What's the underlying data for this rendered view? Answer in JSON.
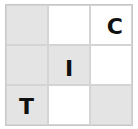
{
  "puzzle": {
    "rows": 3,
    "cols": 3,
    "colors": {
      "shaded": "#e4e4e4",
      "white": "#ffffff",
      "letter": "#111111"
    },
    "cells": [
      {
        "row": 0,
        "col": 0,
        "shaded": true,
        "letter": "",
        "align": "center"
      },
      {
        "row": 0,
        "col": 1,
        "shaded": false,
        "letter": "",
        "align": "center"
      },
      {
        "row": 0,
        "col": 2,
        "shaded": false,
        "letter": "C",
        "align": "center"
      },
      {
        "row": 1,
        "col": 0,
        "shaded": true,
        "letter": "",
        "align": "center"
      },
      {
        "row": 1,
        "col": 1,
        "shaded": true,
        "letter": "I",
        "align": "center"
      },
      {
        "row": 1,
        "col": 2,
        "shaded": false,
        "letter": "",
        "align": "center"
      },
      {
        "row": 2,
        "col": 0,
        "shaded": true,
        "letter": "T",
        "align": "center"
      },
      {
        "row": 2,
        "col": 1,
        "shaded": false,
        "letter": "",
        "align": "center"
      },
      {
        "row": 2,
        "col": 2,
        "shaded": true,
        "letter": "",
        "align": "center"
      }
    ]
  }
}
